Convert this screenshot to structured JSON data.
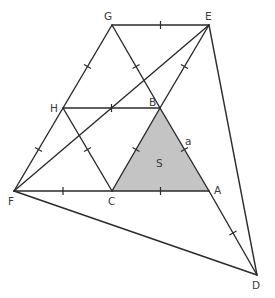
{
  "diagram": {
    "title": "",
    "colors": {
      "line": "#2b2b2b",
      "shade": "#c4c4c4",
      "label": "#3a3a3a",
      "background": "#ffffff"
    },
    "points": {
      "G": {
        "label": "G",
        "x": 112,
        "y": 25
      },
      "E": {
        "label": "E",
        "x": 209,
        "y": 25
      },
      "H": {
        "label": "H",
        "x": 63,
        "y": 108
      },
      "B": {
        "label": "B",
        "x": 160,
        "y": 108
      },
      "F": {
        "label": "F",
        "x": 14,
        "y": 191
      },
      "C": {
        "label": "C",
        "x": 112,
        "y": 191
      },
      "A": {
        "label": "A",
        "x": 209,
        "y": 191
      },
      "D": {
        "label": "D",
        "x": 257,
        "y": 275
      }
    },
    "segments": [
      [
        "G",
        "E"
      ],
      [
        "G",
        "H"
      ],
      [
        "H",
        "F"
      ],
      [
        "G",
        "B"
      ],
      [
        "B",
        "A"
      ],
      [
        "A",
        "D"
      ],
      [
        "E",
        "B"
      ],
      [
        "E",
        "D"
      ],
      [
        "H",
        "B"
      ],
      [
        "H",
        "C"
      ],
      [
        "B",
        "C"
      ],
      [
        "F",
        "C"
      ],
      [
        "C",
        "A"
      ],
      [
        "F",
        "E"
      ],
      [
        "F",
        "D"
      ]
    ],
    "tick_marks_on": [
      [
        "G",
        "E"
      ],
      [
        "G",
        "H"
      ],
      [
        "H",
        "F"
      ],
      [
        "G",
        "B"
      ],
      [
        "E",
        "B"
      ],
      [
        "H",
        "B"
      ],
      [
        "H",
        "C"
      ],
      [
        "B",
        "C"
      ],
      [
        "F",
        "C"
      ],
      [
        "C",
        "A"
      ],
      [
        "B",
        "A"
      ],
      [
        "A",
        "D"
      ]
    ],
    "shaded_region": {
      "vertices": [
        "B",
        "C",
        "A"
      ],
      "label": "S"
    },
    "side_label": {
      "text": "a",
      "side": [
        "B",
        "A"
      ]
    },
    "labels": {
      "G": "G",
      "E": "E",
      "H": "H",
      "B": "B",
      "F": "F",
      "C": "C",
      "A": "A",
      "D": "D",
      "area": "S",
      "side": "a"
    }
  }
}
